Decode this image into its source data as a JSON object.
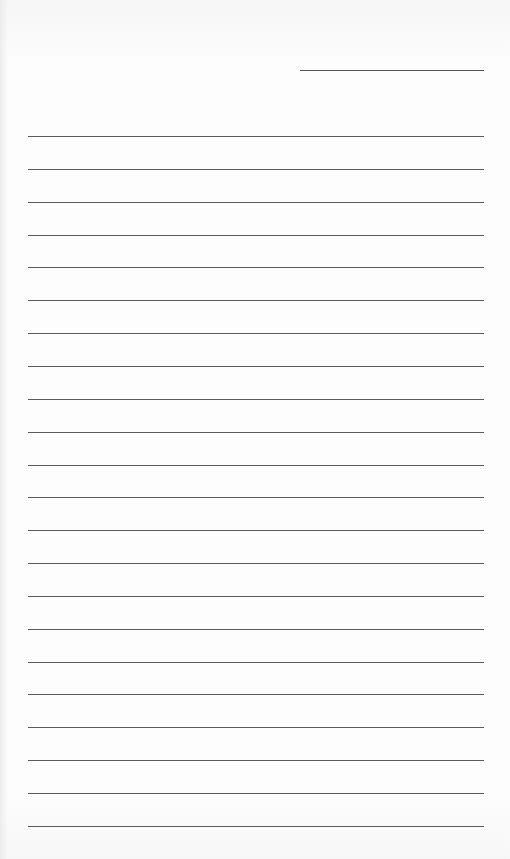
{
  "document": {
    "type": "blank lined paper",
    "header_line": {
      "label": ""
    },
    "line_count": 22,
    "lines": [
      {
        "text": ""
      },
      {
        "text": ""
      },
      {
        "text": ""
      },
      {
        "text": ""
      },
      {
        "text": ""
      },
      {
        "text": ""
      },
      {
        "text": ""
      },
      {
        "text": ""
      },
      {
        "text": ""
      },
      {
        "text": ""
      },
      {
        "text": ""
      },
      {
        "text": ""
      },
      {
        "text": ""
      },
      {
        "text": ""
      },
      {
        "text": ""
      },
      {
        "text": ""
      },
      {
        "text": ""
      },
      {
        "text": ""
      },
      {
        "text": ""
      },
      {
        "text": ""
      },
      {
        "text": ""
      },
      {
        "text": ""
      }
    ],
    "colors": {
      "paper": "#fbfbfb",
      "rule": "#5a5a5a"
    }
  }
}
